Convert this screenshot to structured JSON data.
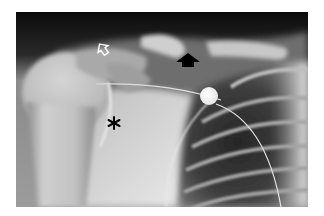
{
  "image": {
    "kind": "radiograph",
    "subject": "shoulder frontal view",
    "frame": {
      "left": 16,
      "top": 12,
      "width": 292,
      "height": 195
    },
    "background_color": "#ffffff",
    "palette": {
      "air_dark": "#0a0a0a",
      "soft_tissue": "#8e8e8e",
      "bone_light": "#d8d8d8",
      "lung_dark": "#3a3a3a",
      "marker_bright": "#f4f4f4"
    }
  },
  "annotations": [
    {
      "id": "open-arrow",
      "type": "open-arrow",
      "color": "#ffffff",
      "x": 103,
      "y": 49,
      "direction": "up-left"
    },
    {
      "id": "solid-arrow",
      "type": "solid-arrow",
      "color": "#000000",
      "x": 188,
      "y": 58,
      "direction": "up"
    },
    {
      "id": "asterisk",
      "type": "asterisk",
      "symbol": "*",
      "color": "#000000",
      "x": 114,
      "y": 123
    }
  ],
  "markers": [
    {
      "id": "round-opacity",
      "type": "circle",
      "color": "#f4f4f4",
      "x": 209,
      "y": 96,
      "radius": 9
    }
  ]
}
